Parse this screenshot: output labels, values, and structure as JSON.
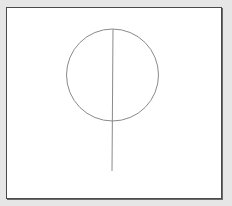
{
  "diagram": {
    "background_color": "#e6e6e6",
    "panel_color": "#ffffff",
    "panel_border_color": "#4a4a4a",
    "stroke_color": "#8a8a8a",
    "shapes": [
      {
        "type": "circle",
        "cx": 112.5,
        "cy": 75,
        "r": 46
      },
      {
        "type": "line",
        "x1": 113,
        "y1": 29,
        "x2": 112,
        "y2": 171
      }
    ]
  }
}
